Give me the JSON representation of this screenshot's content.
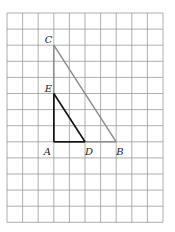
{
  "figure": {
    "grid": {
      "columns": 10,
      "rows": 13,
      "left": 7,
      "top": 13,
      "cell_w": 15.6,
      "cell_h": 16.1,
      "line_color": "#9a9a9a"
    },
    "points": {
      "A": {
        "label": "A",
        "col": 3,
        "row": 8
      },
      "B": {
        "label": "B",
        "col": 7,
        "row": 8
      },
      "C": {
        "label": "C",
        "col": 3,
        "row": 2
      },
      "D": {
        "label": "D",
        "col": 5,
        "row": 8
      },
      "E": {
        "label": "E",
        "col": 3,
        "row": 5
      }
    },
    "triangles": [
      {
        "name": "ACB",
        "color": "#8a8a8a"
      },
      {
        "name": "AED",
        "color": "#111111"
      }
    ],
    "caption": "Figure 13-48"
  }
}
